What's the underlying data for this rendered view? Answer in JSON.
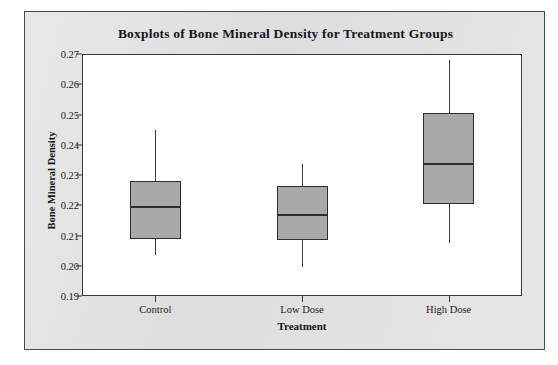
{
  "chart_data": {
    "type": "box",
    "title": "Boxplots of Bone Mineral Density for Treatment Groups",
    "xlabel": "Treatment",
    "ylabel": "Bone Mineral Density",
    "categories": [
      "Control",
      "Low Dose",
      "High Dose"
    ],
    "ylim": [
      0.19,
      0.27
    ],
    "ytick_labels": [
      "0.27",
      "0.26",
      "0.25",
      "0.24",
      "0.23",
      "0.22",
      "0.21",
      "0.20",
      "0.19"
    ],
    "ytick_values": [
      0.27,
      0.26,
      0.25,
      0.24,
      0.23,
      0.22,
      0.21,
      0.2,
      0.19
    ],
    "grid": false,
    "legend": "none",
    "boxes": [
      {
        "category": "Control",
        "whisker_low": 0.2035,
        "q1": 0.209,
        "median": 0.2195,
        "q3": 0.228,
        "whisker_high": 0.245,
        "outliers": []
      },
      {
        "category": "Low Dose",
        "whisker_low": 0.1995,
        "q1": 0.2085,
        "median": 0.2168,
        "q3": 0.2265,
        "whisker_high": 0.2335,
        "outliers": []
      },
      {
        "category": "High Dose",
        "whisker_low": 0.2075,
        "q1": 0.2205,
        "median": 0.2335,
        "q3": 0.2505,
        "whisker_high": 0.268,
        "outliers": []
      }
    ],
    "colors": {
      "box_fill": "#a9a9a9",
      "box_border": "#2e2e2e",
      "whisker": "#3c3c3c",
      "plot_background": "#ffffff",
      "figure_background": "#dcdcdc",
      "axis": "#3a3a3a",
      "text": "#17171a"
    }
  }
}
